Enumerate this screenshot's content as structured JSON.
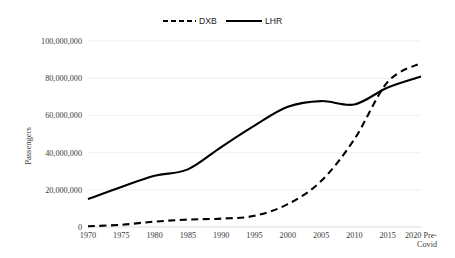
{
  "chart_data": {
    "type": "line",
    "title": "",
    "xlabel": "",
    "ylabel": "Passengers",
    "ylim": [
      0,
      100000000
    ],
    "grid": true,
    "legend_position": "top-center",
    "x": [
      "1970",
      "1975",
      "1980",
      "1985",
      "1990",
      "1995",
      "2000",
      "2005",
      "2010",
      "2015",
      "2020 Pre-Covid"
    ],
    "x_tick_labels": [
      "1970",
      "1975",
      "1980",
      "1985",
      "1990",
      "1995",
      "2000",
      "2005",
      "2010",
      "2015",
      "2020 Pre-"
    ],
    "x_tick_label_last_line2": "Covid",
    "y_tick_labels": [
      "0",
      "20,000,000",
      "40,000,000",
      "60,000,000",
      "80,000,000",
      "100,000,000"
    ],
    "y_tick_values": [
      0,
      20000000,
      40000000,
      60000000,
      80000000,
      100000000
    ],
    "series": [
      {
        "name": "DXB",
        "style": "dashed",
        "color": "#000000",
        "values": [
          400000,
          1200000,
          2900000,
          4000000,
          4500000,
          6000000,
          12300000,
          24700000,
          47200000,
          78000000,
          88200000
        ]
      },
      {
        "name": "LHR",
        "style": "solid",
        "color": "#000000",
        "values": [
          15000000,
          21500000,
          27500000,
          31000000,
          43000000,
          54500000,
          64600000,
          67700000,
          65900000,
          75000000,
          80900000
        ]
      }
    ]
  },
  "legend": {
    "entries": [
      {
        "label": "DXB",
        "style": "dashed"
      },
      {
        "label": "LHR",
        "style": "solid"
      }
    ]
  }
}
